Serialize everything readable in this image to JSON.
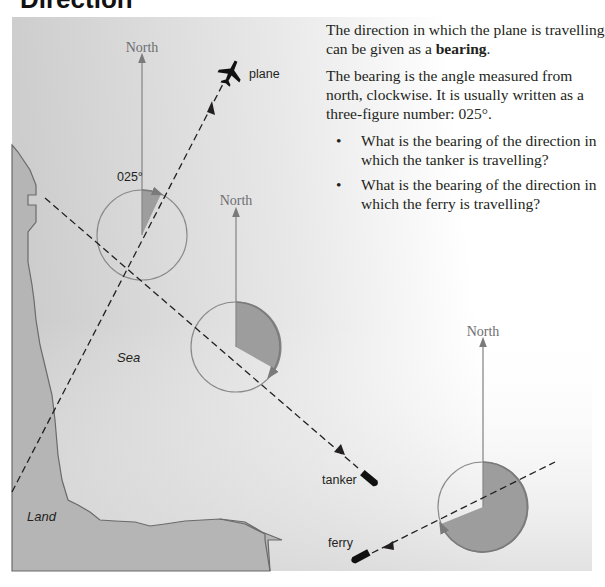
{
  "title": "Direction",
  "text": {
    "para1_prefix": "The direction in which the plane is travelling can be given as a ",
    "para1_bold": "bearing",
    "para1_suffix": ".",
    "para2": "The bearing is the angle measured from north, clockwise. It is usually written as a three-figure number: 025°.",
    "bullets": [
      {
        "bullet": "•",
        "text": "What is the bearing of the direction in which the tanker is travelling?"
      },
      {
        "bullet": "•",
        "text": "What is the bearing of the direction in which the ferry is travelling?"
      }
    ]
  },
  "diagram": {
    "north_label": "North",
    "plane": {
      "label": "plane",
      "bearing_label": "025°",
      "icon": "plane-icon"
    },
    "tanker": {
      "label": "tanker",
      "icon": "ship-icon"
    },
    "ferry": {
      "label": "ferry",
      "icon": "ship-icon"
    },
    "sea_label": "Sea",
    "land_label": "Land",
    "colors": {
      "shaded_angle": "#9d9d9d",
      "compass_line": "#8a8a8a",
      "land": "#b3b3b3",
      "sea_light": "#ffffff",
      "sea_dark": "#cfcfcf"
    }
  }
}
